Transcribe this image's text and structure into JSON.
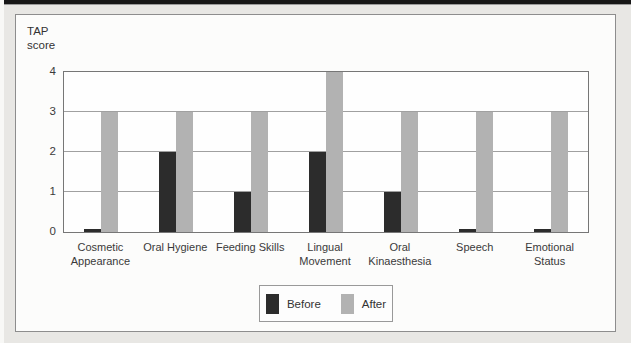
{
  "page": {
    "background_color": "#e8e7e4",
    "top_rule_color": "#171717"
  },
  "chart_data": {
    "type": "bar",
    "title": "",
    "xlabel": "",
    "ylabel": "TAP\nscore",
    "categories": [
      "Cosmetic Appearance",
      "Oral Hygiene",
      "Feeding Skills",
      "Lingual Movement",
      "Oral Kinaesthesia",
      "Speech",
      "Emotional Status"
    ],
    "series": [
      {
        "name": "Before",
        "color": "#2c2c2c",
        "values": [
          0,
          2,
          1,
          2,
          1,
          0,
          0
        ]
      },
      {
        "name": "After",
        "color": "#b2b2b2",
        "values": [
          3,
          3,
          3,
          4,
          3,
          3,
          3
        ]
      }
    ],
    "ylim": [
      0,
      4
    ],
    "yticks": [
      0,
      1,
      2,
      3,
      4
    ],
    "grid": true,
    "legend": {
      "position": "bottom-center",
      "entries": [
        {
          "label": "Before",
          "color": "#2c2c2c"
        },
        {
          "label": "After",
          "color": "#b2b2b2"
        }
      ]
    }
  }
}
